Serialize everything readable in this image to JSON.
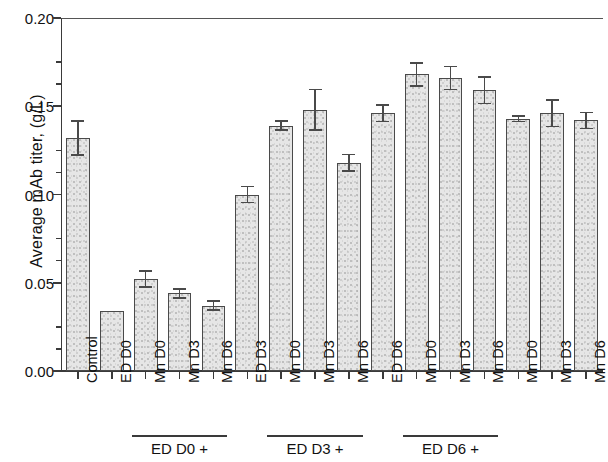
{
  "chart_data": {
    "type": "bar",
    "title": "",
    "xlabel": "",
    "ylabel": "Average mAb titer, (g/L)",
    "ylim": [
      0.0,
      0.2
    ],
    "ytick_labels": [
      "0.00",
      "0.05",
      "0.10",
      "0.15",
      "0.20"
    ],
    "ytick_values": [
      0.0,
      0.05,
      0.1,
      0.15,
      0.2
    ],
    "yminor_step": 0.0125,
    "grid": false,
    "legend": null,
    "categories": [
      "Control",
      "ED D0",
      "Mn D0",
      "Mn D3",
      "Mn D6",
      "ED D3",
      "Mn D0",
      "Mn D3",
      "Mn D6",
      "ED D6",
      "Mn D0",
      "Mn D3",
      "Mn D6",
      "Mn D0",
      "Mn D3",
      "Mn D6"
    ],
    "values": [
      0.132,
      0.034,
      0.052,
      0.044,
      0.037,
      0.1,
      0.139,
      0.148,
      0.118,
      0.146,
      0.168,
      0.166,
      0.159,
      0.143,
      0.146,
      0.142
    ],
    "errors": [
      0.01,
      0.0,
      0.005,
      0.003,
      0.003,
      0.005,
      0.003,
      0.012,
      0.005,
      0.005,
      0.007,
      0.007,
      0.008,
      0.002,
      0.008,
      0.005
    ],
    "group_brackets": [
      {
        "label": "ED D0 +",
        "start_index": 2,
        "end_index": 4
      },
      {
        "label": "ED D3 +",
        "start_index": 6,
        "end_index": 8
      },
      {
        "label": "ED D6 +",
        "start_index": 10,
        "end_index": 12
      }
    ]
  },
  "axis": {
    "y_label": "Average mAb titer, (g/L)"
  }
}
